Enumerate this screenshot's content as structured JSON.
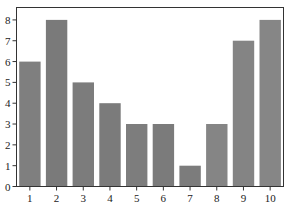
{
  "chart_data": {
    "type": "bar",
    "title": "",
    "xlabel": "",
    "ylabel": "",
    "categories": [
      "1",
      "2",
      "3",
      "4",
      "5",
      "6",
      "7",
      "8",
      "9",
      "10"
    ],
    "values": [
      6,
      8,
      5,
      4,
      3,
      3,
      1,
      3,
      7,
      8
    ],
    "ylim": [
      0,
      8.5
    ],
    "yticks": [
      0,
      1,
      2,
      3,
      4,
      5,
      6,
      7,
      8
    ],
    "grid": false,
    "legend": null,
    "bar_colors": [
      "#7f7f7f",
      "#7a7a7a",
      "#7c7c7c",
      "#7b7b7b",
      "#7d7d7d",
      "#7b7b7b",
      "#7c7c7c",
      "#858585",
      "#848484",
      "#868686"
    ]
  },
  "style": {
    "axis_color": "#333333",
    "background": "#ffffff"
  }
}
